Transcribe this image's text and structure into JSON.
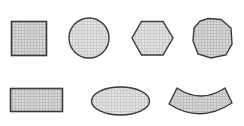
{
  "diagram": {
    "title": "",
    "background": "#ffffff",
    "stroke_color": "#3a3a3a",
    "fill_color": "#d9d9d9",
    "fill_pattern": "crosshatch-grid",
    "rows": [
      {
        "shapes": [
          {
            "name": "square",
            "type": "rect"
          },
          {
            "name": "circle",
            "type": "circle"
          },
          {
            "name": "hexagon",
            "type": "polygon",
            "sides": 6
          },
          {
            "name": "octagon",
            "type": "polygon",
            "sides": 8
          }
        ]
      },
      {
        "shapes": [
          {
            "name": "rectangle",
            "type": "rect"
          },
          {
            "name": "ellipse",
            "type": "ellipse"
          },
          {
            "name": "arc-segment",
            "type": "annular-sector"
          }
        ]
      }
    ]
  }
}
